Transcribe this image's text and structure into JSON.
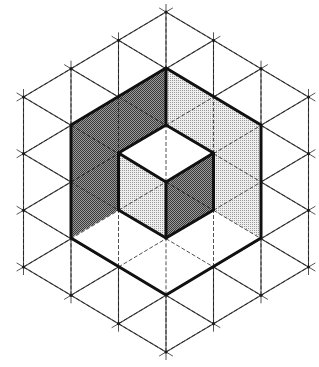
{
  "diagram": {
    "title": "",
    "canvas": {
      "width": 319,
      "height": 367
    },
    "lattice": {
      "center": [
        166,
        182
      ],
      "vertical_step": 56.67,
      "column_step": 47.5,
      "radius": 3,
      "overhang": 8,
      "line_color": "#4a4a4a"
    },
    "colors": {
      "dark_fill": "#7a7a7a",
      "light_fill": "#d0d0d0",
      "white_fill": "#ffffff",
      "outline": "#111111"
    },
    "regions": [
      {
        "name": "left-wall-dark",
        "shade": "dark",
        "points": [
          [
            71,
            125
          ],
          [
            166,
            68
          ],
          [
            166,
            125
          ],
          [
            118.5,
            153
          ],
          [
            118.5,
            210
          ],
          [
            71,
            238
          ]
        ]
      },
      {
        "name": "right-wall-light",
        "shade": "light",
        "points": [
          [
            166,
            68
          ],
          [
            261,
            125
          ],
          [
            261,
            238
          ],
          [
            213.5,
            210
          ],
          [
            213.5,
            153
          ],
          [
            166,
            125
          ]
        ]
      },
      {
        "name": "inner-cube-top",
        "shade": "white",
        "points": [
          [
            166,
            125
          ],
          [
            213.5,
            153
          ],
          [
            166,
            182
          ],
          [
            118.5,
            153
          ]
        ]
      },
      {
        "name": "inner-cube-left",
        "shade": "light",
        "points": [
          [
            118.5,
            153
          ],
          [
            166,
            182
          ],
          [
            166,
            238
          ],
          [
            118.5,
            210
          ]
        ]
      },
      {
        "name": "inner-cube-right",
        "shade": "dark",
        "points": [
          [
            166,
            182
          ],
          [
            213.5,
            153
          ],
          [
            213.5,
            210
          ],
          [
            166,
            238
          ]
        ]
      },
      {
        "name": "floor",
        "shade": "white",
        "points": [
          [
            71,
            238
          ],
          [
            118.5,
            210
          ],
          [
            166,
            238
          ],
          [
            213.5,
            210
          ],
          [
            261,
            238
          ],
          [
            166,
            295
          ]
        ]
      }
    ],
    "outlines": [
      {
        "name": "outer-hexagon",
        "closed": true,
        "points": [
          [
            166,
            68
          ],
          [
            261,
            125
          ],
          [
            261,
            238
          ],
          [
            166,
            295
          ],
          [
            71,
            238
          ],
          [
            71,
            125
          ]
        ]
      },
      {
        "name": "inner-hexagon",
        "closed": true,
        "points": [
          [
            166,
            125
          ],
          [
            213.5,
            153
          ],
          [
            213.5,
            210
          ],
          [
            166,
            238
          ],
          [
            118.5,
            210
          ],
          [
            118.5,
            153
          ]
        ]
      },
      {
        "name": "top-divider",
        "closed": false,
        "points": [
          [
            166,
            68
          ],
          [
            166,
            125
          ]
        ]
      },
      {
        "name": "inner-y-left",
        "closed": false,
        "points": [
          [
            118.5,
            153
          ],
          [
            166,
            182
          ]
        ]
      },
      {
        "name": "inner-y-right",
        "closed": false,
        "points": [
          [
            213.5,
            153
          ],
          [
            166,
            182
          ]
        ]
      },
      {
        "name": "inner-y-down",
        "closed": false,
        "points": [
          [
            166,
            182
          ],
          [
            166,
            238
          ]
        ]
      }
    ]
  }
}
